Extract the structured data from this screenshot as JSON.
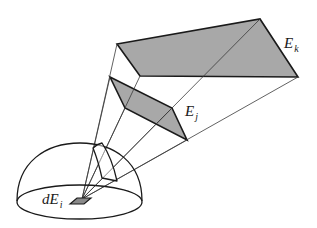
{
  "figure": {
    "labels": {
      "ek": {
        "base": "E",
        "sub": "k"
      },
      "ej": {
        "base": "E",
        "sub": "j"
      },
      "dei": {
        "base": "dE",
        "sub": "i"
      }
    },
    "colors": {
      "fill": "#a8a8a8",
      "stroke": "#1a1a1a",
      "thin_line": "#3a3a3a",
      "background": "#ffffff"
    }
  }
}
